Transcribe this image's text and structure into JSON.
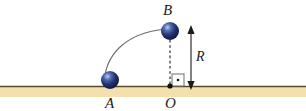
{
  "figure": {
    "width": 306,
    "height": 111,
    "background": "#ffffff"
  },
  "labels": {
    "point_a": "A",
    "point_b": "B",
    "point_o": "O",
    "distance_r": "R"
  },
  "credit": {
    "text": "Ilustrações/Arquivo da editora"
  },
  "colors": {
    "ground_band": "#f2e0ad",
    "ground_line": "#5c4a25",
    "ball_dark": "#13205a",
    "ball_mid": "#2c3f86",
    "ball_highlight": "#b9cde8",
    "arc_stroke": "#6e6e6e",
    "dashed_stroke": "#2a2a3c",
    "arrow_stroke": "#1a1a1a",
    "marker_stroke": "#6d6d6d",
    "label_text": "#1a1a1a",
    "credit_text": "#8d8d8d"
  },
  "geometry": {
    "ball_a": {
      "cx": 110,
      "cy": 80,
      "r": 9
    },
    "ball_b": {
      "cx": 170,
      "cy": 31,
      "r": 9
    },
    "origin_o": {
      "x": 170,
      "y": 88
    },
    "arc": {
      "from_x": 104,
      "from_y": 86,
      "to_x": 167,
      "to_y": 30
    },
    "dashed_line": {
      "x": 170,
      "y1": 40,
      "y2": 85
    },
    "arrow_r": {
      "x": 191,
      "y_top": 27,
      "y_bottom": 88
    },
    "ground": {
      "x1": 0,
      "x2": 306,
      "y_top": 86,
      "band_height": 11
    },
    "right_angle_marker": {
      "x": 172,
      "y": 73,
      "size": 12
    }
  }
}
